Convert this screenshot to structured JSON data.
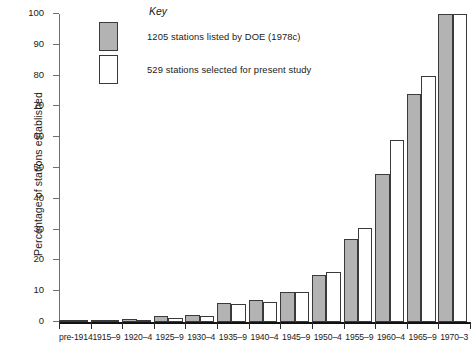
{
  "chart_data": {
    "type": "bar",
    "title": "",
    "xlabel": "",
    "ylabel": "Percentage of stations established",
    "ylim": [
      0,
      100
    ],
    "ytick_step": 10,
    "yticks": [
      0,
      10,
      20,
      30,
      40,
      50,
      60,
      70,
      80,
      90,
      100
    ],
    "grid": false,
    "legend_position": "top-center",
    "legend_title": "Key",
    "categories": [
      "pre-1914",
      "1915–9",
      "1920–4",
      "1925–9",
      "1930–4",
      "1935–9",
      "1940–4",
      "1945–9",
      "1950–4",
      "1955–9",
      "1960–4",
      "1965–9",
      "1970–3"
    ],
    "series": [
      {
        "name": "1205 stations listed by DOE (1978c)",
        "color": "#b3b3b3",
        "values": [
          0.6,
          0.8,
          1.0,
          1.8,
          2.2,
          6.2,
          7.2,
          9.6,
          15.4,
          27.0,
          48.0,
          74.0,
          100.0
        ]
      },
      {
        "name": "529 stations selected for present study",
        "color": "#ffffff",
        "values": [
          0.4,
          0.6,
          0.8,
          1.4,
          1.8,
          6.0,
          6.4,
          9.8,
          16.2,
          30.5,
          59.0,
          80.0,
          100.0
        ]
      }
    ]
  },
  "legend": {
    "title": "Key",
    "items": [
      {
        "swatch": "grey",
        "label": "1205 stations listed by DOE (1978c)"
      },
      {
        "swatch": "white",
        "label": "529 stations selected for present study"
      }
    ]
  },
  "axes": {
    "y_title": "Percentage of stations established"
  }
}
